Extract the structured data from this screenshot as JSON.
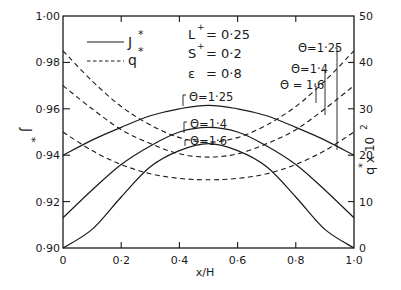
{
  "chart_data": {
    "type": "line",
    "title": "",
    "xlabel": "x/H",
    "ylabel": "J*",
    "ylabel_right": "q* x 10^2",
    "xlim": [
      0,
      1.0
    ],
    "ylim": [
      0.9,
      1.0
    ],
    "ylim_right": [
      0,
      50
    ],
    "grid": false,
    "x_ticks": [
      "0",
      "0·2",
      "0·4",
      "0·6",
      "0·8",
      "1·0"
    ],
    "y_ticks": [
      "0·90",
      "0·92",
      "0·94",
      "0·96",
      "0·98",
      "1·00"
    ],
    "y_ticks_right": [
      "0",
      "10",
      "20",
      "30",
      "40",
      "50"
    ],
    "legend": [
      {
        "label": "J*",
        "style": "solid"
      },
      {
        "label": "q*",
        "style": "dashed"
      }
    ],
    "legend_position": "upper left",
    "parameters": [
      "L+ = 0·25",
      "S+ = 0·2",
      "ε = 0·8"
    ],
    "x": [
      0,
      0.1,
      0.2,
      0.3,
      0.4,
      0.5,
      0.6,
      0.7,
      0.8,
      0.9,
      1.0
    ],
    "series": [
      {
        "name": "J*, Θ=1·25",
        "axis": "left",
        "style": "solid",
        "label": "Θ=1·25",
        "values": [
          0.94,
          0.9465,
          0.952,
          0.957,
          0.96,
          0.9615,
          0.96,
          0.957,
          0.952,
          0.9465,
          0.94
        ]
      },
      {
        "name": "J*, Θ=1·4",
        "axis": "left",
        "style": "solid",
        "label": "Θ=1·4",
        "values": [
          0.913,
          0.925,
          0.936,
          0.944,
          0.95,
          0.952,
          0.95,
          0.944,
          0.936,
          0.925,
          0.913
        ]
      },
      {
        "name": "J*, Θ=1·6",
        "axis": "left",
        "style": "solid",
        "label": "Θ=1·6",
        "values": [
          0.9,
          0.908,
          0.922,
          0.935,
          0.942,
          0.945,
          0.942,
          0.935,
          0.922,
          0.908,
          0.9
        ]
      },
      {
        "name": "q*, Θ=1·6",
        "axis": "right",
        "style": "dashed",
        "label": "Θ=1·6",
        "values": [
          42.5,
          36,
          30.5,
          26.5,
          23.8,
          22.8,
          23.8,
          26.5,
          30.5,
          36,
          42.5
        ]
      },
      {
        "name": "q*, Θ=1·4",
        "axis": "right",
        "style": "dashed",
        "label": "Θ=1·4",
        "values": [
          35,
          30,
          25.5,
          22.5,
          20.3,
          19.6,
          20.3,
          22.5,
          25.5,
          30,
          35
        ]
      },
      {
        "name": "q*, Θ=1·25",
        "axis": "right",
        "style": "dashed",
        "label": "Θ=1·25",
        "values": [
          25,
          21,
          18,
          16,
          15,
          14.7,
          15,
          16,
          18,
          21,
          25
        ]
      }
    ],
    "annotations": {
      "solid_labels": [
        "Θ=1·25",
        "Θ=1·4",
        "Θ=1·6"
      ],
      "dashed_labels": [
        "Θ=1·25",
        "Θ=1·4",
        "Θ = 1·6"
      ]
    }
  },
  "labels": {
    "xlabel": "x/H",
    "ylabel_main": "J",
    "ylabel_star": "*",
    "ylabel_right_q": "q",
    "ylabel_right_rest": " x 10",
    "ylabel_right_exp": "2",
    "legend_j": "J",
    "legend_q": "q",
    "star": "*",
    "param_l": "L",
    "param_l_val": "= 0·25",
    "param_s": "S",
    "param_s_val": "= 0·2",
    "param_e": "ε",
    "param_e_val": "= 0·8",
    "plus": "+",
    "solid_125": "Θ=1·25",
    "solid_14": "Θ=1·4",
    "solid_16": "Θ=1·6",
    "dashed_125": "Θ=1·25",
    "dashed_14": "Θ=1·4",
    "dashed_16": "Θ = 1·6"
  }
}
